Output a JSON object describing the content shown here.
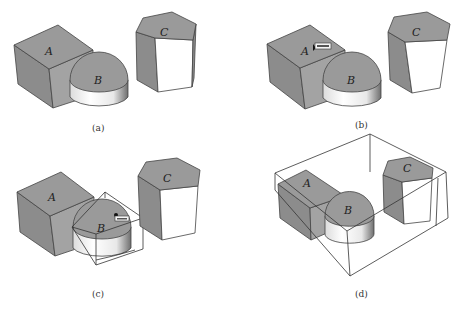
{
  "figure": {
    "panels": [
      {
        "id": "a",
        "caption": "(a)",
        "objects": [
          {
            "label": "A",
            "shape": "box"
          },
          {
            "label": "B",
            "shape": "cylinder"
          },
          {
            "label": "C",
            "shape": "hexagonal-prism"
          }
        ],
        "selection": "none"
      },
      {
        "id": "b",
        "caption": "(b)",
        "objects": [
          {
            "label": "A",
            "shape": "box"
          },
          {
            "label": "B",
            "shape": "cylinder"
          },
          {
            "label": "C",
            "shape": "hexagonal-prism"
          }
        ],
        "selection": "cursor-hover-on-A"
      },
      {
        "id": "c",
        "caption": "(c)",
        "objects": [
          {
            "label": "A",
            "shape": "box"
          },
          {
            "label": "B",
            "shape": "cylinder"
          },
          {
            "label": "C",
            "shape": "hexagonal-prism"
          }
        ],
        "selection": "B-bounding-box"
      },
      {
        "id": "d",
        "caption": "(d)",
        "objects": [
          {
            "label": "A",
            "shape": "box"
          },
          {
            "label": "B",
            "shape": "cylinder"
          },
          {
            "label": "C",
            "shape": "hexagonal-prism"
          }
        ],
        "selection": "all-bounding-box"
      }
    ]
  },
  "colors": {
    "face_top": "#9a9a9a",
    "face_side": "#8c8c8c",
    "face_white": "#ffffff",
    "edge": "#444444",
    "background": "#ffffff"
  }
}
